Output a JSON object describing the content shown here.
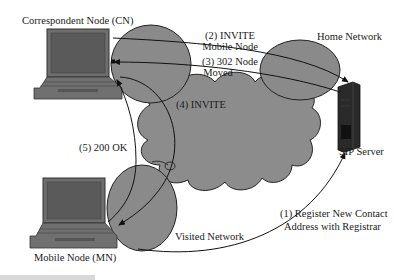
{
  "diagram": {
    "type": "network-diagram",
    "topic": "SIP mobility via redirect",
    "colors": {
      "background": "#ffffff",
      "network_fill": "#8a8a8a",
      "stroke": "#222222",
      "device": "#6e6e6e",
      "server": "#2a2a2a"
    },
    "nodes": {
      "cn": {
        "label": "Correspondent Node (CN)",
        "icon": "laptop-icon"
      },
      "mn": {
        "label": "Mobile Node (MN)",
        "icon": "laptop-icon"
      },
      "sip": {
        "label": "SIP Server",
        "icon": "server-tower-icon"
      }
    },
    "networks": {
      "home": {
        "label": "Home Network"
      },
      "visited": {
        "label": "Visited Network"
      },
      "internet": {
        "label": ""
      }
    },
    "messages": [
      {
        "step": 1,
        "line1": "(1) Register New Contact",
        "line2": "Address with Registrar",
        "from": "MN",
        "to": "SIP Server"
      },
      {
        "step": 2,
        "line1": "(2) INVITE",
        "line2": "Mobile Node",
        "from": "CN",
        "to": "SIP Server"
      },
      {
        "step": 3,
        "line1": "(3) 302 Node",
        "line2": "Moved",
        "from": "SIP Server",
        "to": "CN"
      },
      {
        "step": 4,
        "line1": "(4) INVITE",
        "line2": "",
        "from": "CN",
        "to": "MN"
      },
      {
        "step": 5,
        "line1": "(5) 200 OK",
        "line2": "",
        "from": "MN",
        "to": "CN"
      }
    ]
  }
}
